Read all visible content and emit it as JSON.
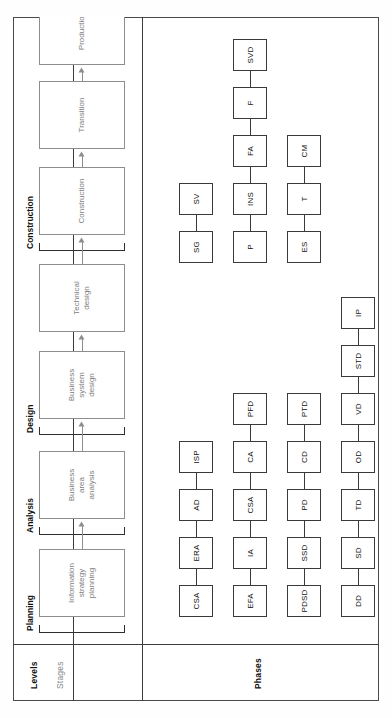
{
  "diagram": {
    "row_labels": {
      "levels": "Levels",
      "stages": "Stages",
      "phases": "Phases"
    },
    "levels": [
      {
        "id": "planning",
        "label": "Planning"
      },
      {
        "id": "analysis",
        "label": "Analysis"
      },
      {
        "id": "design",
        "label": "Design"
      },
      {
        "id": "construction",
        "label": "Construction"
      }
    ],
    "stages": [
      {
        "id": "isp",
        "label": "Information strategy planning",
        "lines": [
          "Information",
          "strategy",
          "planning"
        ],
        "level": "planning"
      },
      {
        "id": "baa",
        "label": "Business area analysis",
        "lines": [
          "Business",
          "area",
          "analysis"
        ],
        "level": "analysis"
      },
      {
        "id": "bsd",
        "label": "Business system design",
        "lines": [
          "Business",
          "system",
          "design"
        ],
        "level": "design"
      },
      {
        "id": "td",
        "label": "Technical design",
        "lines": [
          "Technical",
          "design"
        ],
        "level": "design"
      },
      {
        "id": "con",
        "label": "Construction",
        "lines": [
          "Construction"
        ],
        "level": "construction"
      },
      {
        "id": "tra",
        "label": "Transition",
        "lines": [
          "Transition"
        ],
        "level": "construction"
      },
      {
        "id": "pro",
        "label": "Production",
        "lines": [
          "Production"
        ],
        "level": "construction"
      }
    ],
    "phase_groups": [
      {
        "stage": "isp",
        "phases": [
          "CSA",
          "ERA",
          "AD",
          "ISP"
        ]
      },
      {
        "stage": "baa",
        "phases": [
          "EFA",
          "IA",
          "CSA",
          "CA",
          "PFD"
        ]
      },
      {
        "stage": "bsd",
        "phases": [
          "PDSD",
          "SSD",
          "PD",
          "CD",
          "PTD"
        ]
      },
      {
        "stage": "td",
        "phases": [
          "DD",
          "SD",
          "TD",
          "OD",
          "VD",
          "STD",
          "IP"
        ]
      },
      {
        "stage": "con",
        "phases": [
          "SG",
          "SV"
        ]
      },
      {
        "stage": "tra",
        "phases": [
          "P",
          "INS",
          "FA",
          "F",
          "SVD"
        ]
      },
      {
        "stage": "pro",
        "phases": [
          "ES",
          "T",
          "CM"
        ]
      }
    ],
    "colors": {
      "frame": "#4a4a4a",
      "stage_box": "#8d8d8d",
      "phase_box": "#3a3a3a",
      "text": "#111111",
      "stage_text": "#7d7d7d",
      "background": "#ffffff"
    }
  }
}
